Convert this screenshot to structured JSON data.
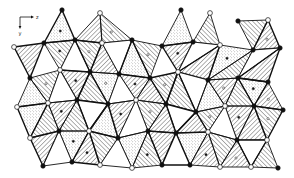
{
  "figure": {
    "type": "crystal-structure-polyhedral-projection",
    "axes": {
      "horizontal_label": "z",
      "vertical_label": "y"
    },
    "colors": {
      "line": "#111111",
      "background": "#ffffff",
      "open_atom_fill": "#ffffff",
      "filled_atom_fill": "#111111"
    },
    "vertices": [
      {
        "id": "a1",
        "x": 62,
        "y": 10,
        "kind": "filled"
      },
      {
        "id": "a2",
        "x": 181,
        "y": 10,
        "kind": "filled"
      },
      {
        "id": "a3",
        "x": 210,
        "y": 13,
        "kind": "open"
      },
      {
        "id": "a4",
        "x": 238,
        "y": 21,
        "kind": "filled"
      },
      {
        "id": "a5",
        "x": 268,
        "y": 20,
        "kind": "open"
      },
      {
        "id": "a6",
        "x": 100,
        "y": 13,
        "kind": "open"
      },
      {
        "id": "b1",
        "x": 14,
        "y": 47,
        "kind": "open"
      },
      {
        "id": "b2",
        "x": 44,
        "y": 43,
        "kind": "filled"
      },
      {
        "id": "b3",
        "x": 75,
        "y": 40,
        "kind": "filled"
      },
      {
        "id": "b4",
        "x": 102,
        "y": 43,
        "kind": "open"
      },
      {
        "id": "b5",
        "x": 132,
        "y": 40,
        "kind": "filled"
      },
      {
        "id": "b6",
        "x": 162,
        "y": 46,
        "kind": "filled"
      },
      {
        "id": "b7",
        "x": 193,
        "y": 42,
        "kind": "filled"
      },
      {
        "id": "b8",
        "x": 220,
        "y": 45,
        "kind": "open"
      },
      {
        "id": "b9",
        "x": 253,
        "y": 50,
        "kind": "filled"
      },
      {
        "id": "b10",
        "x": 280,
        "y": 48,
        "kind": "filled"
      },
      {
        "id": "c1",
        "x": 30,
        "y": 78,
        "kind": "filled"
      },
      {
        "id": "c2",
        "x": 60,
        "y": 70,
        "kind": "open"
      },
      {
        "id": "c3",
        "x": 90,
        "y": 72,
        "kind": "filled"
      },
      {
        "id": "c4",
        "x": 119,
        "y": 74,
        "kind": "filled"
      },
      {
        "id": "c5",
        "x": 150,
        "y": 78,
        "kind": "filled"
      },
      {
        "id": "c6",
        "x": 178,
        "y": 72,
        "kind": "open"
      },
      {
        "id": "c7",
        "x": 208,
        "y": 80,
        "kind": "filled"
      },
      {
        "id": "c8",
        "x": 238,
        "y": 78,
        "kind": "filled"
      },
      {
        "id": "c9",
        "x": 268,
        "y": 82,
        "kind": "filled"
      },
      {
        "id": "d1",
        "x": 17,
        "y": 107,
        "kind": "open"
      },
      {
        "id": "d2",
        "x": 48,
        "y": 103,
        "kind": "open"
      },
      {
        "id": "d3",
        "x": 77,
        "y": 100,
        "kind": "filled"
      },
      {
        "id": "d4",
        "x": 108,
        "y": 104,
        "kind": "filled"
      },
      {
        "id": "d5",
        "x": 136,
        "y": 100,
        "kind": "open"
      },
      {
        "id": "d6",
        "x": 166,
        "y": 104,
        "kind": "filled"
      },
      {
        "id": "d7",
        "x": 196,
        "y": 112,
        "kind": "filled"
      },
      {
        "id": "d8",
        "x": 225,
        "y": 106,
        "kind": "open"
      },
      {
        "id": "d9",
        "x": 254,
        "y": 106,
        "kind": "filled"
      },
      {
        "id": "d10",
        "x": 283,
        "y": 110,
        "kind": "filled"
      },
      {
        "id": "e1",
        "x": 30,
        "y": 138,
        "kind": "open"
      },
      {
        "id": "e2",
        "x": 59,
        "y": 131,
        "kind": "filled"
      },
      {
        "id": "e3",
        "x": 89,
        "y": 131,
        "kind": "open"
      },
      {
        "id": "e4",
        "x": 118,
        "y": 138,
        "kind": "filled"
      },
      {
        "id": "e5",
        "x": 148,
        "y": 131,
        "kind": "filled"
      },
      {
        "id": "e6",
        "x": 176,
        "y": 133,
        "kind": "filled"
      },
      {
        "id": "e7",
        "x": 208,
        "y": 132,
        "kind": "open"
      },
      {
        "id": "e8",
        "x": 237,
        "y": 140,
        "kind": "filled"
      },
      {
        "id": "e9",
        "x": 267,
        "y": 140,
        "kind": "open"
      },
      {
        "id": "f1",
        "x": 43,
        "y": 166,
        "kind": "filled"
      },
      {
        "id": "f2",
        "x": 72,
        "y": 162,
        "kind": "filled"
      },
      {
        "id": "f3",
        "x": 100,
        "y": 165,
        "kind": "open"
      },
      {
        "id": "f4",
        "x": 132,
        "y": 168,
        "kind": "open"
      },
      {
        "id": "f5",
        "x": 162,
        "y": 165,
        "kind": "filled"
      },
      {
        "id": "f6",
        "x": 190,
        "y": 165,
        "kind": "filled"
      },
      {
        "id": "f7",
        "x": 220,
        "y": 167,
        "kind": "open"
      },
      {
        "id": "f8",
        "x": 251,
        "y": 167,
        "kind": "open"
      },
      {
        "id": "f9",
        "x": 278,
        "y": 168,
        "kind": "filled"
      }
    ],
    "triangles": [
      {
        "v": [
          "a1",
          "b2",
          "b3"
        ],
        "fill": "dots"
      },
      {
        "v": [
          "a6",
          "b3",
          "b4"
        ],
        "fill": "hatch-right"
      },
      {
        "v": [
          "a6",
          "b4",
          "b5"
        ],
        "fill": "hatch-left"
      },
      {
        "v": [
          "b1",
          "b2",
          "c1"
        ],
        "fill": "hatch-right"
      },
      {
        "v": [
          "b2",
          "b3",
          "c2"
        ],
        "fill": "hatch-left"
      },
      {
        "v": [
          "b3",
          "c2",
          "c3"
        ],
        "fill": "none"
      },
      {
        "v": [
          "b3",
          "b4",
          "c3"
        ],
        "fill": "hatch-left"
      },
      {
        "v": [
          "b4",
          "c3",
          "c4"
        ],
        "fill": "hatch-right"
      },
      {
        "v": [
          "b4",
          "b5",
          "c4"
        ],
        "fill": "none"
      },
      {
        "v": [
          "b5",
          "c4",
          "c5"
        ],
        "fill": "dots"
      },
      {
        "v": [
          "b5",
          "b6",
          "c5"
        ],
        "fill": "hatch-left"
      },
      {
        "v": [
          "a2",
          "b6",
          "b7"
        ],
        "fill": "dots"
      },
      {
        "v": [
          "b6",
          "b7",
          "c6"
        ],
        "fill": "hatch-right"
      },
      {
        "v": [
          "a3",
          "b7",
          "b8"
        ],
        "fill": "hatch-left"
      },
      {
        "v": [
          "b7",
          "b8",
          "c6"
        ],
        "fill": "none"
      },
      {
        "v": [
          "b8",
          "c6",
          "c7"
        ],
        "fill": "hatch-right"
      },
      {
        "v": [
          "b8",
          "b9",
          "c7"
        ],
        "fill": "dots"
      },
      {
        "v": [
          "a4",
          "a5",
          "b9"
        ],
        "fill": "hatch-left"
      },
      {
        "v": [
          "a5",
          "b9",
          "b10"
        ],
        "fill": "hatch-right"
      },
      {
        "v": [
          "b9",
          "c7",
          "c8"
        ],
        "fill": "hatch-left"
      },
      {
        "v": [
          "b9",
          "b10",
          "c8"
        ],
        "fill": "none"
      },
      {
        "v": [
          "b10",
          "c8",
          "c9"
        ],
        "fill": "hatch-right"
      },
      {
        "v": [
          "c1",
          "c2",
          "d2"
        ],
        "fill": "hatch-left"
      },
      {
        "v": [
          "c1",
          "d1",
          "d2"
        ],
        "fill": "dots"
      },
      {
        "v": [
          "c2",
          "c3",
          "d3"
        ],
        "fill": "hatch-right"
      },
      {
        "v": [
          "c2",
          "d2",
          "d3"
        ],
        "fill": "none"
      },
      {
        "v": [
          "c3",
          "c4",
          "d4"
        ],
        "fill": "dots"
      },
      {
        "v": [
          "c3",
          "d3",
          "d4"
        ],
        "fill": "hatch-left"
      },
      {
        "v": [
          "c4",
          "c5",
          "d5"
        ],
        "fill": "hatch-right"
      },
      {
        "v": [
          "c4",
          "d4",
          "d5"
        ],
        "fill": "none"
      },
      {
        "v": [
          "c5",
          "c6",
          "d6"
        ],
        "fill": "hatch-left"
      },
      {
        "v": [
          "c5",
          "d5",
          "d6"
        ],
        "fill": "hatch-right"
      },
      {
        "v": [
          "c6",
          "c7",
          "d7"
        ],
        "fill": "none"
      },
      {
        "v": [
          "c6",
          "d6",
          "d7"
        ],
        "fill": "hatch-left"
      },
      {
        "v": [
          "c7",
          "c8",
          "d8"
        ],
        "fill": "hatch-right"
      },
      {
        "v": [
          "c7",
          "d7",
          "d8"
        ],
        "fill": "dots"
      },
      {
        "v": [
          "c8",
          "c9",
          "d9"
        ],
        "fill": "dots"
      },
      {
        "v": [
          "c8",
          "d8",
          "d9"
        ],
        "fill": "hatch-left"
      },
      {
        "v": [
          "c9",
          "d9",
          "d10"
        ],
        "fill": "hatch-right"
      },
      {
        "v": [
          "d1",
          "d2",
          "e1"
        ],
        "fill": "dots"
      },
      {
        "v": [
          "d2",
          "d3",
          "e2"
        ],
        "fill": "hatch-right"
      },
      {
        "v": [
          "d2",
          "e1",
          "e2"
        ],
        "fill": "hatch-left"
      },
      {
        "v": [
          "d3",
          "d4",
          "e3"
        ],
        "fill": "none"
      },
      {
        "v": [
          "d3",
          "e2",
          "e3"
        ],
        "fill": "hatch-left"
      },
      {
        "v": [
          "d4",
          "d5",
          "e4"
        ],
        "fill": "hatch-right"
      },
      {
        "v": [
          "d4",
          "e3",
          "e4"
        ],
        "fill": "dots"
      },
      {
        "v": [
          "d5",
          "d6",
          "e5"
        ],
        "fill": "hatch-left"
      },
      {
        "v": [
          "d5",
          "e4",
          "e5"
        ],
        "fill": "none"
      },
      {
        "v": [
          "d6",
          "d7",
          "e6"
        ],
        "fill": "none"
      },
      {
        "v": [
          "d6",
          "e5",
          "e6"
        ],
        "fill": "hatch-right"
      },
      {
        "v": [
          "d7",
          "d8",
          "e7"
        ],
        "fill": "hatch-left"
      },
      {
        "v": [
          "d7",
          "e6",
          "e7"
        ],
        "fill": "hatch-right"
      },
      {
        "v": [
          "d8",
          "d9",
          "e8"
        ],
        "fill": "hatch-right"
      },
      {
        "v": [
          "d8",
          "e7",
          "e8"
        ],
        "fill": "none"
      },
      {
        "v": [
          "d9",
          "d10",
          "e9"
        ],
        "fill": "hatch-left"
      },
      {
        "v": [
          "d9",
          "e8",
          "e9"
        ],
        "fill": "hatch-right"
      },
      {
        "v": [
          "e2",
          "e3",
          "f2"
        ],
        "fill": "dots"
      },
      {
        "v": [
          "e1",
          "e2",
          "f1"
        ],
        "fill": "hatch-right"
      },
      {
        "v": [
          "e2",
          "f1",
          "f2"
        ],
        "fill": "none"
      },
      {
        "v": [
          "e3",
          "e4",
          "f3"
        ],
        "fill": "hatch-left"
      },
      {
        "v": [
          "e3",
          "f2",
          "f3"
        ],
        "fill": "hatch-right"
      },
      {
        "v": [
          "e4",
          "e5",
          "f4"
        ],
        "fill": "dots"
      },
      {
        "v": [
          "e4",
          "f3",
          "f4"
        ],
        "fill": "none"
      },
      {
        "v": [
          "e5",
          "e6",
          "f5"
        ],
        "fill": "hatch-right"
      },
      {
        "v": [
          "e5",
          "f4",
          "f5"
        ],
        "fill": "hatch-left"
      },
      {
        "v": [
          "e6",
          "e7",
          "f6"
        ],
        "fill": "dots"
      },
      {
        "v": [
          "e6",
          "f5",
          "f6"
        ],
        "fill": "none"
      },
      {
        "v": [
          "e7",
          "e8",
          "f7"
        ],
        "fill": "hatch-left"
      },
      {
        "v": [
          "e7",
          "f6",
          "f7"
        ],
        "fill": "hatch-right"
      },
      {
        "v": [
          "e8",
          "e9",
          "f8"
        ],
        "fill": "none"
      },
      {
        "v": [
          "e8",
          "f7",
          "f8"
        ],
        "fill": "hatch-right"
      },
      {
        "v": [
          "e9",
          "f8",
          "f9"
        ],
        "fill": "hatch-left"
      }
    ]
  }
}
